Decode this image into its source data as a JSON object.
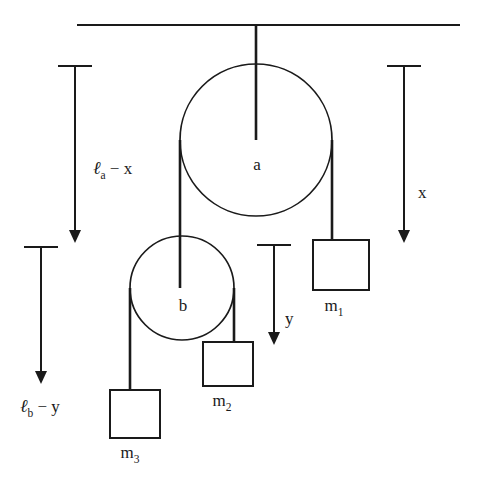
{
  "diagram": {
    "colors": {
      "line": "#1a1a1a",
      "background": "#ffffff"
    },
    "ceiling": {
      "name": "ceiling-support-line",
      "x1": 77,
      "x2": 460,
      "y": 25
    },
    "pulleys": [
      {
        "id": "a",
        "label": "a",
        "cx": 256,
        "cy": 140,
        "r": 76,
        "label_x": 257,
        "label_y": 170
      },
      {
        "id": "b",
        "label": "b",
        "cx": 182,
        "cy": 288,
        "r": 52,
        "label_x": 183,
        "label_y": 311
      }
    ],
    "masses": [
      {
        "id": "m1",
        "label": "m",
        "subscript": "1",
        "x": 313,
        "y": 240,
        "w": 56,
        "h": 50,
        "label_x": 334,
        "label_y": 311
      },
      {
        "id": "m2",
        "label": "m",
        "subscript": "2",
        "x": 203,
        "y": 342,
        "w": 50,
        "h": 44,
        "label_x": 222,
        "label_y": 406
      },
      {
        "id": "m3",
        "label": "m",
        "subscript": "3",
        "x": 110,
        "y": 390,
        "w": 50,
        "h": 48,
        "label_x": 130,
        "label_y": 458
      }
    ],
    "dimensions": [
      {
        "id": "la-minus-x",
        "ell": "ℓ",
        "ell_sub": "a",
        "operator": " − x",
        "x": 75,
        "y_top": 66,
        "y_bottom": 243,
        "cap_half": 17,
        "label_x": 93,
        "label_y": 174,
        "label_anchor": "start"
      },
      {
        "id": "x",
        "text": "x",
        "x": 404,
        "y_top": 66,
        "y_bottom": 243,
        "cap_half": 17,
        "label_x": 418,
        "label_y": 198,
        "label_anchor": "start"
      },
      {
        "id": "lb-minus-y",
        "ell": "ℓ",
        "ell_sub": "b",
        "operator": " − y",
        "x": 41,
        "y_top": 247,
        "y_bottom": 384,
        "cap_half": 17,
        "label_x": 20,
        "label_y": 412,
        "label_anchor": "start"
      },
      {
        "id": "y",
        "text": "y",
        "x": 274,
        "y_top": 245,
        "y_bottom": 345,
        "cap_half": 17,
        "label_x": 285,
        "label_y": 324,
        "label_anchor": "start"
      }
    ],
    "ropes": [
      {
        "id": "ceiling-to-pulley-a",
        "d": "M 256 25 L 256 140"
      },
      {
        "id": "pulley-a-left-to-pulley-b",
        "d": "M 180 140 L 180 288"
      },
      {
        "id": "pulley-a-right-to-m1",
        "d": "M 332 140 L 332 240"
      },
      {
        "id": "pulley-b-left-to-m3",
        "d": "M 130 288 L 130 390"
      },
      {
        "id": "pulley-b-right-to-m2",
        "d": "M 234 288 L 234 342"
      }
    ]
  }
}
